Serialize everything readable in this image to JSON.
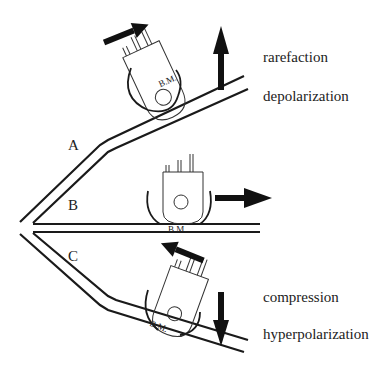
{
  "diagram": {
    "regions": [
      {
        "id": "A",
        "label": "A"
      },
      {
        "id": "B",
        "label": "B"
      },
      {
        "id": "C",
        "label": "C"
      }
    ],
    "membrane_label": "B.M.",
    "states": {
      "top": {
        "line1": "rarefaction",
        "line2": "depolarization",
        "arrow": "up"
      },
      "bottom": {
        "line1": "compression",
        "line2": "hyperpolarization",
        "arrow": "down"
      }
    },
    "middle_arrow": "right",
    "colors": {
      "stroke": "#1a1a1a",
      "cell_outline": "#333333",
      "background": "#ffffff"
    }
  }
}
